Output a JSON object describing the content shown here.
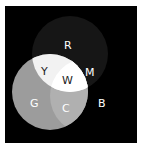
{
  "diagram": {
    "background": "#000000",
    "circles": [
      {
        "name": "red",
        "label": "R",
        "fill": "#161616"
      },
      {
        "name": "green",
        "label": "G",
        "fill": "#9c9c9c"
      },
      {
        "name": "blue",
        "label": "B",
        "fill": "#000000"
      }
    ],
    "regions": {
      "yellow": {
        "label": "Y",
        "fill": "#f2f2f2"
      },
      "white": {
        "label": "W",
        "fill": "#ffffff"
      },
      "magenta": {
        "label": "M"
      },
      "cyan": {
        "label": "C",
        "fill": "#b0b0b0"
      }
    },
    "labels": {
      "R": "R",
      "G": "G",
      "B": "B",
      "Y": "Y",
      "W": "W",
      "M": "M",
      "C": "C"
    }
  },
  "caption": ""
}
